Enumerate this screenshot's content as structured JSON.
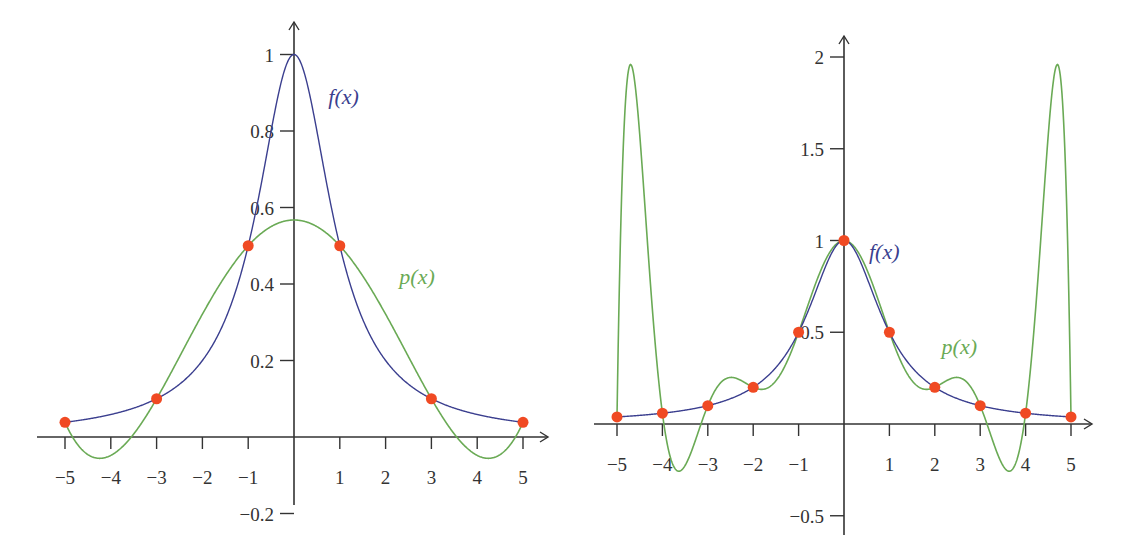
{
  "colors": {
    "f_curve": "#3b3f8f",
    "p_curve": "#6aaa55",
    "nodes": "#f04a23",
    "axis": "#333333"
  },
  "chart_data": [
    {
      "type": "line",
      "title": "",
      "description": "Runge function f(x)=1/(1+x^2) and its degree-5 interpolating polynomial p(x) at 6 equally spaced nodes",
      "xlabel": "",
      "ylabel": "",
      "xlim": [
        -5.5,
        5.5
      ],
      "ylim": [
        -0.25,
        1.05
      ],
      "x_ticks": [
        -5,
        -4,
        -3,
        -2,
        -1,
        1,
        2,
        3,
        4,
        5
      ],
      "x_tick_labels": [
        "−5",
        "−4",
        "−3",
        "−2",
        "−1",
        "1",
        "2",
        "3",
        "4",
        "5"
      ],
      "y_ticks": [
        -0.2,
        0.2,
        0.4,
        0.6,
        0.8,
        1
      ],
      "y_tick_labels": [
        "−0.2",
        "0.2",
        "0.4",
        "0.6",
        "0.8",
        "1"
      ],
      "grid": false,
      "series": [
        {
          "name": "f(x)",
          "label": "f(x)",
          "formula": "1/(1+x^2)",
          "x_range": [
            -5,
            5
          ]
        },
        {
          "name": "p(x)",
          "label": "p(x)",
          "x_range": [
            -5,
            5
          ],
          "interp_nodes_x": [
            -5,
            -3,
            -1,
            1,
            3,
            5
          ]
        }
      ],
      "nodes": {
        "x": [
          -5,
          -3,
          -1,
          1,
          3,
          5
        ],
        "y": [
          0.0385,
          0.1,
          0.5,
          0.5,
          0.1,
          0.0385
        ]
      },
      "annotations": [
        {
          "text": "f(x)",
          "x": 0.75,
          "y": 0.87
        },
        {
          "text": "p(x)",
          "x": 2.3,
          "y": 0.4
        }
      ]
    },
    {
      "type": "line",
      "title": "",
      "description": "Runge function f(x)=1/(1+x^2) and its degree-10 interpolating polynomial p(x) at 11 equally spaced nodes",
      "xlabel": "",
      "ylabel": "",
      "xlim": [
        -5.5,
        5.5
      ],
      "ylim": [
        -0.55,
        2.1
      ],
      "x_ticks": [
        -5,
        -4,
        -3,
        -2,
        -1,
        1,
        2,
        3,
        4,
        5
      ],
      "x_tick_labels": [
        "−5",
        "−4",
        "−3",
        "−2",
        "−1",
        "1",
        "2",
        "3",
        "4",
        "5"
      ],
      "y_ticks": [
        -0.5,
        0.5,
        1,
        1.5,
        2
      ],
      "y_tick_labels": [
        "−0.5",
        "0.5",
        "1",
        "1.5",
        "2"
      ],
      "grid": false,
      "series": [
        {
          "name": "f(x)",
          "label": "f(x)",
          "formula": "1/(1+x^2)",
          "x_range": [
            -5,
            5
          ]
        },
        {
          "name": "p(x)",
          "label": "p(x)",
          "x_range": [
            -5,
            5
          ],
          "interp_nodes_x": [
            -5,
            -4,
            -3,
            -2,
            -1,
            0,
            1,
            2,
            3,
            4,
            5
          ],
          "peak_values": {
            "x": [
              -4.8,
              4.8
            ],
            "y": [
              1.92,
              1.92
            ]
          }
        }
      ],
      "nodes": {
        "x": [
          -5,
          -4,
          -3,
          -2,
          -1,
          0,
          1,
          2,
          3,
          4,
          5
        ],
        "y": [
          0.0385,
          0.0588,
          0.1,
          0.2,
          0.5,
          1,
          0.5,
          0.2,
          0.1,
          0.0588,
          0.0385
        ]
      },
      "annotations": [
        {
          "text": "f(x)",
          "x": 0.55,
          "y": 0.9
        },
        {
          "text": "p(x)",
          "x": 2.15,
          "y": 0.38
        }
      ]
    }
  ],
  "layout": [
    {
      "origin_px": [
        294,
        437
      ],
      "x_unit_px": 45.8,
      "y_unit_px": 382.5,
      "y_axis_top_px": 22,
      "y_axis_bottom_px": 505,
      "x_axis_left_px": 37,
      "x_axis_right_px": 548
    },
    {
      "origin_px": [
        844,
        424
      ],
      "x_unit_px": 45.4,
      "y_unit_px": 183.5,
      "y_axis_top_px": 36,
      "y_axis_bottom_px": 535,
      "x_axis_left_px": 594,
      "x_axis_right_px": 1092
    }
  ]
}
